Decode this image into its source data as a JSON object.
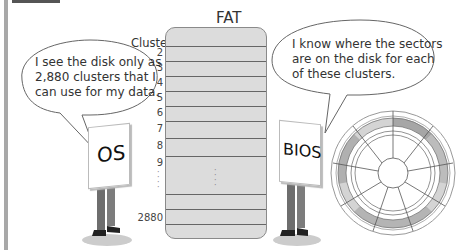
{
  "fat": {
    "title": "FAT",
    "cluster_label": "Cluster",
    "rows": [
      "2",
      "3",
      "4",
      "5",
      "6",
      "7",
      "8",
      "9"
    ],
    "last_row": "2880"
  },
  "os": {
    "sign": "OS",
    "speech": [
      "I see the disk only as",
      "2,880 clusters that I",
      "can use for my data."
    ]
  },
  "bios": {
    "sign": "BIOS",
    "speech": [
      "I know where the sectors",
      "are on the disk for each",
      "of these clusters."
    ]
  },
  "colors": {
    "fat_fill": "#dcdcdc",
    "disk_band_dark": "#a6a6a6",
    "disk_band_light": "#d4d4d4"
  }
}
